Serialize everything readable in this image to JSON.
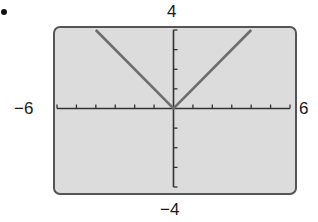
{
  "chart_data": {
    "type": "line",
    "title": "",
    "xlabel": "",
    "ylabel": "",
    "function": "y = |x|",
    "xlim": [
      -6,
      6
    ],
    "ylim": [
      -4,
      4
    ],
    "x_tick_step": 1,
    "y_tick_step": 1,
    "grid": false,
    "legend": null,
    "series": [
      {
        "name": "y = |x|",
        "x": [
          -4,
          0,
          4
        ],
        "y": [
          4,
          0,
          4
        ],
        "color": "#6e6e6e"
      }
    ]
  },
  "window_labels": {
    "ymax": "4",
    "ymin": "−4",
    "xmin": "−6",
    "xmax": "6"
  },
  "colors": {
    "screen_background": "#dcdcdc",
    "screen_border": "#555555",
    "axis": "#333333",
    "graph_line": "#6e6e6e"
  }
}
